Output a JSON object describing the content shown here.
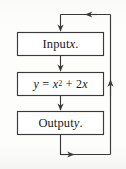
{
  "diagram": {
    "type": "flowchart",
    "nodes": [
      {
        "id": "input",
        "shape": "rectangle",
        "text_plain": "Input x.",
        "text_lead": "Input ",
        "var": "x",
        "text_tail": "."
      },
      {
        "id": "process",
        "shape": "rectangle",
        "text_plain": "y = x2 + 2x",
        "lhs": "y",
        "eq": "=",
        "rhs_base": "x",
        "rhs_exp": "2",
        "plus": "+",
        "rhs2_coef": "2",
        "rhs2_var": "x"
      },
      {
        "id": "output",
        "shape": "rectangle",
        "text_plain": "Output y.",
        "text_lead": "Output ",
        "var": "y",
        "text_tail": "."
      }
    ],
    "edges": [
      {
        "id": "edge-loop-into-input",
        "from": "loop-return",
        "to": "input",
        "arrowheads": [
          "left",
          "down"
        ]
      },
      {
        "id": "edge-input-process",
        "from": "input",
        "to": "process",
        "arrowheads": [
          "down"
        ]
      },
      {
        "id": "edge-process-output",
        "from": "process",
        "to": "output",
        "arrowheads": [
          "down"
        ]
      },
      {
        "id": "edge-output-loop",
        "from": "output",
        "to": "loop-return",
        "arrowheads": [
          "right",
          "up"
        ]
      }
    ],
    "colors": {
      "stroke": "#3a3a3a",
      "box_fill": "#ffffff",
      "text": "#1a1a1a",
      "background": "#fdfdfc"
    }
  }
}
